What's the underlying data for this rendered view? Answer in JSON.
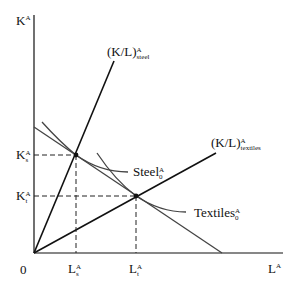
{
  "diagram": {
    "type": "isoquant-isocost",
    "axes": {
      "y_label": {
        "base": "K",
        "sup": "A"
      },
      "x_label": {
        "base": "L",
        "sup": "A"
      },
      "origin_label": "0"
    },
    "rays": [
      {
        "id": "steel",
        "label": {
          "base": "(K/L)",
          "sup": "A",
          "sub": "steel"
        }
      },
      {
        "id": "textiles",
        "label": {
          "base": "(K/L)",
          "sup": "A",
          "sub": "textiles"
        }
      }
    ],
    "isoquants": [
      {
        "id": "steel",
        "label": {
          "base": "Steel",
          "sup": "A",
          "sub": "0"
        }
      },
      {
        "id": "textiles",
        "label": {
          "base": "Textiles",
          "sup": "A",
          "sub": "0"
        }
      }
    ],
    "tick_labels": {
      "k_steel": {
        "base": "K",
        "sup": "A",
        "sub": "s"
      },
      "k_textiles": {
        "base": "K",
        "sup": "A",
        "sub": "t"
      },
      "l_steel": {
        "base": "L",
        "sup": "A",
        "sub": "s"
      },
      "l_textiles": {
        "base": "L",
        "sup": "A",
        "sub": "t"
      }
    },
    "colors": {
      "ray": "#111111",
      "curve": "#444444",
      "guide": "#222222"
    }
  }
}
